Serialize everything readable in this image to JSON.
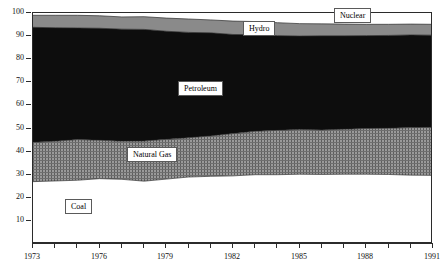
{
  "chart_data": {
    "type": "area",
    "title": "",
    "subtitle": "",
    "xlabel": "",
    "ylabel": "",
    "xlim": [
      1973,
      1991
    ],
    "ylim": [
      0,
      100
    ],
    "grid": false,
    "stacked": true,
    "legend_position": "inline-labels",
    "x": [
      1973,
      1974,
      1975,
      1976,
      1977,
      1978,
      1979,
      1980,
      1981,
      1982,
      1983,
      1984,
      1985,
      1986,
      1987,
      1988,
      1989,
      1990,
      1991
    ],
    "series": [
      {
        "name": "Coal",
        "fill": "white",
        "values": [
          27.0,
          27.3,
          27.6,
          28.3,
          28.0,
          27.2,
          28.1,
          29.0,
          29.3,
          29.5,
          30.0,
          30.0,
          30.2,
          30.1,
          30.2,
          30.2,
          30.1,
          29.8,
          29.7
        ]
      },
      {
        "name": "Natural Gas",
        "fill": "gray-hatch",
        "values": [
          17.0,
          17.2,
          17.6,
          16.6,
          16.5,
          17.4,
          17.2,
          17.0,
          17.5,
          18.3,
          18.8,
          19.2,
          19.4,
          19.3,
          19.5,
          19.8,
          20.0,
          20.6,
          20.8
        ]
      },
      {
        "name": "Petroleum",
        "fill": "black",
        "values": [
          49.8,
          49.1,
          48.3,
          48.5,
          48.5,
          48.3,
          46.8,
          45.6,
          44.6,
          42.9,
          41.8,
          41.0,
          40.4,
          40.7,
          40.4,
          40.2,
          40.2,
          40.1,
          39.9
        ]
      },
      {
        "name": "Hydro",
        "fill": "gray-solid",
        "values": [
          5.2,
          5.4,
          5.5,
          5.4,
          5.3,
          5.5,
          5.7,
          5.8,
          5.6,
          5.8,
          5.7,
          5.6,
          5.4,
          5.2,
          5.1,
          4.9,
          4.8,
          4.7,
          4.7
        ]
      },
      {
        "name": "Nuclear",
        "fill": "white",
        "values": [
          1.0,
          1.0,
          1.0,
          1.2,
          1.7,
          1.6,
          2.2,
          2.6,
          3.0,
          3.5,
          3.7,
          4.2,
          4.6,
          4.7,
          4.8,
          4.9,
          4.9,
          4.8,
          4.9
        ]
      }
    ],
    "y_ticks": [
      10,
      20,
      30,
      40,
      50,
      60,
      70,
      80,
      90,
      100
    ],
    "y_tick_labels": [
      "10",
      "20",
      "30",
      "40",
      "50",
      "60",
      "70",
      "80",
      "90",
      "100"
    ],
    "x_ticks": [
      1973,
      1974,
      1975,
      1976,
      1977,
      1978,
      1979,
      1980,
      1981,
      1982,
      1983,
      1984,
      1985,
      1986,
      1987,
      1988,
      1989,
      1990,
      1991
    ],
    "x_tick_labels": [
      {
        "value": 1973,
        "label": "1973"
      },
      {
        "value": 1976,
        "label": "1976"
      },
      {
        "value": 1979,
        "label": "1979"
      },
      {
        "value": 1982,
        "label": "1982"
      },
      {
        "value": 1985,
        "label": "1985"
      },
      {
        "value": 1988,
        "label": "1988"
      },
      {
        "value": 1991,
        "label": "1991"
      }
    ],
    "annotations": [
      {
        "name": "Nuclear",
        "text": "Nuclear",
        "x": 1987.4,
        "y": 98.6
      },
      {
        "name": "Hydro",
        "text": "Hydro",
        "x": 1983.2,
        "y": 93.0
      },
      {
        "name": "Petroleum",
        "text": "Petroleum",
        "x": 1980.6,
        "y": 67.0
      },
      {
        "name": "Natural Gas",
        "text": "Natural Gas",
        "x": 1978.4,
        "y": 38.5
      },
      {
        "name": "Coal",
        "text": "Coal",
        "x": 1975.1,
        "y": 16.0
      }
    ],
    "colors": {
      "axis": "#2b2b2b",
      "coal": "#ffffff",
      "natural_gas": "#7d7d7d",
      "petroleum": "#0d0d0d",
      "hydro": "#8a8a8a",
      "nuclear": "#ffffff",
      "label_border": "#5a5a5a",
      "label_background": "#ffffff",
      "text": "#111111"
    }
  }
}
